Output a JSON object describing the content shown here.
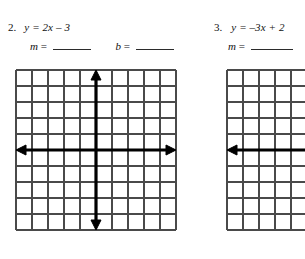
{
  "page": {
    "background_color": "#ffffff",
    "ink_color": "#111111",
    "grid_line_color": "#4a4a4a",
    "axis_color": "#000000"
  },
  "problems": [
    {
      "number": "2.",
      "equation": {
        "full": "y = 2x – 3",
        "lhs": "y",
        "equals": "=",
        "slope_term": "2x",
        "operator": "–",
        "constant": "3"
      },
      "answers": [
        {
          "label": "m",
          "equals": "=",
          "value": "",
          "blank_width_px": 38
        },
        {
          "label": "b",
          "equals": "=",
          "value": "",
          "blank_width_px": 38
        }
      ],
      "graph": {
        "columns": 10,
        "rows": 10,
        "cell_size_px": 16,
        "x_axis_row_from_top": 5,
        "y_axis_col_from_left": 5,
        "x_axis_arrows": "both",
        "y_axis_arrows": "both"
      }
    },
    {
      "number": "3.",
      "equation": {
        "full": "y = –3x + 2",
        "lhs": "y",
        "equals": "=",
        "slope_term": "–3x",
        "operator": "+",
        "constant": "2"
      },
      "answers": [
        {
          "label": "m",
          "equals": "=",
          "value": "",
          "blank_width_px": 42
        }
      ],
      "graph": {
        "columns": 10,
        "rows": 10,
        "cell_size_px": 16,
        "x_axis_row_from_top": 5,
        "y_axis_col_from_left": 5,
        "x_axis_arrows": "left",
        "y_axis_arrows": "none",
        "clipped_right": true
      }
    }
  ]
}
